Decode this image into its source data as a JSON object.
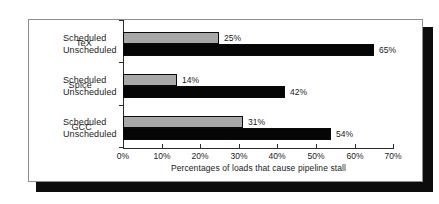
{
  "chart_data": {
    "type": "bar",
    "orientation": "horizontal",
    "title": "",
    "xlabel": "Percentages of loads that cause pipeline stall",
    "ylabel": "",
    "xlim": [
      0,
      70
    ],
    "grid": false,
    "legend": "none",
    "categories": [
      "TeX",
      "Spice",
      "GCC"
    ],
    "series": [
      {
        "name": "Scheduled",
        "values": [
          25,
          14,
          31
        ]
      },
      {
        "name": "Unscheduled",
        "values": [
          65,
          42,
          54
        ]
      }
    ],
    "xticks": [
      0,
      10,
      20,
      30,
      40,
      50,
      60,
      70
    ],
    "xtick_labels": [
      "0%",
      "10%",
      "20%",
      "30%",
      "40%",
      "50%",
      "60%",
      "70%"
    ],
    "bar_value_labels": {
      "TeX": {
        "Scheduled": "25%",
        "Unscheduled": "65%"
      },
      "Spice": {
        "Scheduled": "14%",
        "Unscheduled": "42%"
      },
      "GCC": {
        "Scheduled": "31%",
        "Unscheduled": "54%"
      }
    },
    "colors": {
      "Scheduled": "#a8a8a8",
      "Unscheduled": "#050505",
      "axis": "#2b2b2b",
      "frame": "#8f8f8f",
      "background": "#ffffff"
    }
  },
  "groups": [
    {
      "label": "TeX",
      "rows": [
        {
          "series": "Scheduled",
          "value": 25,
          "value_label": "25%"
        },
        {
          "series": "Unscheduled",
          "value": 65,
          "value_label": "65%"
        }
      ]
    },
    {
      "label": "Spice",
      "rows": [
        {
          "series": "Scheduled",
          "value": 14,
          "value_label": "14%"
        },
        {
          "series": "Unscheduled",
          "value": 42,
          "value_label": "42%"
        }
      ]
    },
    {
      "label": "GCC",
      "rows": [
        {
          "series": "Scheduled",
          "value": 31,
          "value_label": "31%"
        },
        {
          "series": "Unscheduled",
          "value": 54,
          "value_label": "54%"
        }
      ]
    }
  ],
  "axis": {
    "title": "Percentages of loads that cause pipeline stall",
    "ticks": [
      "0%",
      "10%",
      "20%",
      "30%",
      "40%",
      "50%",
      "60%",
      "70%"
    ]
  }
}
